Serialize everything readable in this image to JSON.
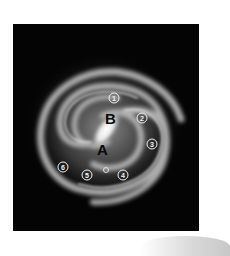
{
  "figure": {
    "background_color": "#040404",
    "labels": {
      "A": "A",
      "B": "B"
    },
    "markers": [
      {
        "id": "1",
        "label": "①",
        "x": 100,
        "y": 75
      },
      {
        "id": "2",
        "label": "②",
        "x": 130,
        "y": 94
      },
      {
        "id": "3",
        "label": "③",
        "x": 139,
        "y": 120
      },
      {
        "id": "4",
        "label": "④",
        "x": 110,
        "y": 151
      },
      {
        "id": "5",
        "label": "⑤",
        "x": 74,
        "y": 151
      },
      {
        "id": "6",
        "label": "⑥",
        "x": 50,
        "y": 143
      }
    ],
    "sun_marker": {
      "x": 93,
      "y": 146
    }
  }
}
